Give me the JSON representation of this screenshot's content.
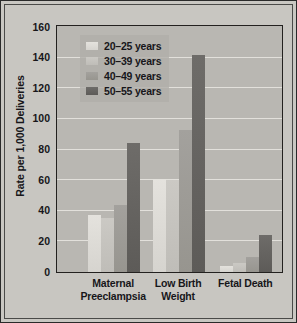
{
  "chart_data": {
    "type": "bar",
    "title": "",
    "xlabel": "",
    "ylabel": "Rate per 1,000 Deliveries",
    "ylim": [
      0,
      160
    ],
    "yticks": [
      0,
      20,
      40,
      60,
      80,
      100,
      120,
      140,
      160
    ],
    "grid": true,
    "legend_position": "top-left",
    "categories": [
      "Maternal Preeclampsia",
      "Low Birth Weight",
      "Fetal Death"
    ],
    "category_lines": [
      [
        "Maternal",
        "Preeclampsia"
      ],
      [
        "Low Birth",
        "Weight"
      ],
      [
        "Fetal Death"
      ]
    ],
    "series": [
      {
        "name": "20–25 years",
        "color": "#dddbd6",
        "values": [
          37,
          61,
          4
        ]
      },
      {
        "name": "30–39 years",
        "color": "#c5c3be",
        "values": [
          35,
          60,
          6
        ]
      },
      {
        "name": "40–49 years",
        "color": "#9d9b96",
        "values": [
          44,
          93,
          10
        ]
      },
      {
        "name": "50–55 years",
        "color": "#66645f",
        "values": [
          84,
          142,
          24
        ]
      }
    ]
  },
  "style": {
    "background": "#c8c6c1",
    "plot_background": "#b9b7b2",
    "gridline_color": "#e9e7e2",
    "text_color": "#17161a",
    "frame_color": "#23211f"
  }
}
